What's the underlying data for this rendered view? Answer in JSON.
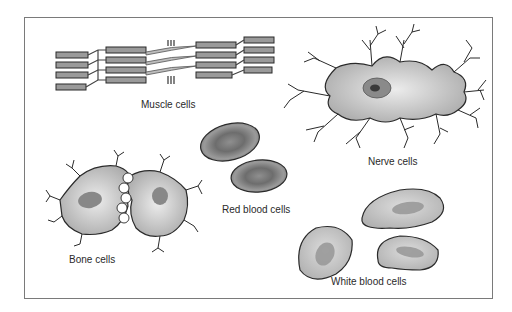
{
  "diagram": {
    "title": "",
    "labels": {
      "muscle": "Muscle cells",
      "nerve": "Nerve cells",
      "red_blood": "Red blood cells",
      "bone": "Bone cells",
      "white_blood": "White blood cells"
    },
    "colors": {
      "cell_fill": "#b8b8b8",
      "cell_outline": "#2a2a2a",
      "nucleus": "#7a7a7a",
      "frame": "#7a7a7a"
    }
  }
}
